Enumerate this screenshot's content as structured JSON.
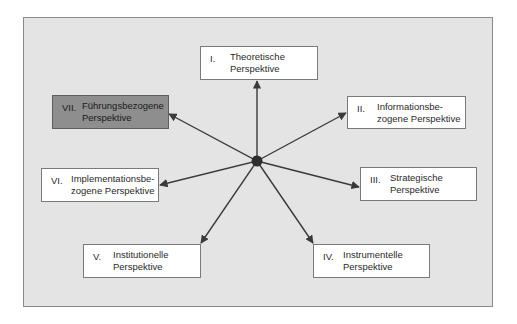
{
  "diagram": {
    "type": "hub-and-spoke",
    "center": {
      "x": 257,
      "y": 161
    },
    "colors": {
      "frame_bg": "#e4e4e4",
      "node_bg": "#ffffff",
      "highlight_bg": "#8e8e8e",
      "arrow": "#3a3a3a",
      "hub": "#2e2e2e"
    },
    "nodes": [
      {
        "id": "I",
        "num": "I.",
        "label": "Theoretische\nPerspektive",
        "highlighted": false
      },
      {
        "id": "II",
        "num": "II.",
        "label": "Informationsbe-\nzogene Perspektive",
        "highlighted": false
      },
      {
        "id": "III",
        "num": "III.",
        "label": "Strategische\nPerspektive",
        "highlighted": false
      },
      {
        "id": "IV",
        "num": "IV.",
        "label": "Instrumentelle\nPerspektive",
        "highlighted": false
      },
      {
        "id": "V",
        "num": "V.",
        "label": "Institutionelle\nPerspektive",
        "highlighted": false
      },
      {
        "id": "VI",
        "num": "VI.",
        "label": "Implementationsbe-\nzogene Perspektive",
        "highlighted": false
      },
      {
        "id": "VII",
        "num": "VII.",
        "label": "Führungsbezogene\nPerspektive",
        "highlighted": true
      }
    ]
  }
}
